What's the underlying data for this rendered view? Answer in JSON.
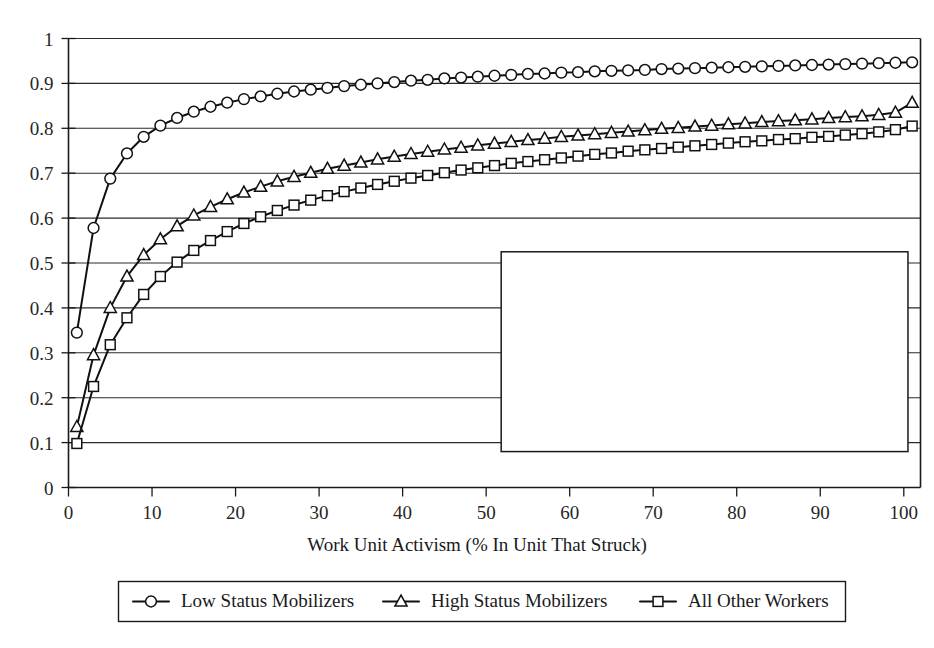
{
  "chart_data": {
    "type": "line",
    "title": "",
    "subtitle": "",
    "xlabel": "Work Unit Activism (% In Unit That Struck)",
    "ylabel": "",
    "xlim": [
      0,
      102
    ],
    "ylim": [
      0,
      1
    ],
    "grid": "horizontal",
    "legend_position": "bottom",
    "xticks": [
      0,
      10,
      20,
      30,
      40,
      50,
      60,
      70,
      80,
      90,
      100
    ],
    "xtick_labels": [
      "0",
      "10",
      "20",
      "30",
      "40",
      "50",
      "60",
      "70",
      "80",
      "90",
      "100"
    ],
    "yticks": [
      0,
      0.1,
      0.2,
      0.3,
      0.4,
      0.5,
      0.6,
      0.7,
      0.8,
      0.9,
      1
    ],
    "ytick_labels": [
      "0",
      "0.1",
      "0.2",
      "0.3",
      "0.4",
      "0.5",
      "0.6",
      "0.7",
      "0.8",
      "0.9",
      "1"
    ],
    "x": [
      1,
      3,
      5,
      7,
      9,
      11,
      13,
      15,
      17,
      19,
      21,
      23,
      25,
      27,
      29,
      31,
      33,
      35,
      37,
      39,
      41,
      43,
      45,
      47,
      49,
      51,
      53,
      55,
      57,
      59,
      61,
      63,
      65,
      67,
      69,
      71,
      73,
      75,
      77,
      79,
      81,
      83,
      85,
      87,
      89,
      91,
      93,
      95,
      97,
      99,
      101
    ],
    "series": [
      {
        "name": "Low Status Mobilizers",
        "marker": "circle",
        "values": [
          0.345,
          0.578,
          0.688,
          0.744,
          0.781,
          0.806,
          0.823,
          0.837,
          0.848,
          0.857,
          0.865,
          0.871,
          0.877,
          0.882,
          0.886,
          0.89,
          0.894,
          0.897,
          0.9,
          0.903,
          0.906,
          0.908,
          0.911,
          0.913,
          0.915,
          0.917,
          0.919,
          0.921,
          0.922,
          0.924,
          0.925,
          0.927,
          0.928,
          0.929,
          0.93,
          0.932,
          0.933,
          0.934,
          0.935,
          0.936,
          0.937,
          0.938,
          0.939,
          0.94,
          0.941,
          0.942,
          0.943,
          0.944,
          0.945,
          0.946,
          0.947
        ]
      },
      {
        "name": "High Status Mobilizers",
        "marker": "triangle",
        "values": [
          0.135,
          0.295,
          0.4,
          0.47,
          0.518,
          0.553,
          0.582,
          0.606,
          0.625,
          0.642,
          0.657,
          0.67,
          0.682,
          0.692,
          0.701,
          0.71,
          0.717,
          0.724,
          0.731,
          0.737,
          0.743,
          0.748,
          0.753,
          0.757,
          0.762,
          0.766,
          0.77,
          0.774,
          0.777,
          0.781,
          0.784,
          0.787,
          0.79,
          0.793,
          0.796,
          0.799,
          0.801,
          0.804,
          0.806,
          0.809,
          0.811,
          0.814,
          0.816,
          0.818,
          0.82,
          0.823,
          0.825,
          0.827,
          0.83,
          0.835,
          0.857
        ]
      },
      {
        "name": "All Other Workers",
        "marker": "square",
        "values": [
          0.098,
          0.225,
          0.318,
          0.378,
          0.43,
          0.47,
          0.502,
          0.528,
          0.55,
          0.57,
          0.588,
          0.603,
          0.617,
          0.629,
          0.64,
          0.65,
          0.659,
          0.667,
          0.675,
          0.682,
          0.689,
          0.695,
          0.701,
          0.707,
          0.712,
          0.717,
          0.722,
          0.726,
          0.73,
          0.734,
          0.738,
          0.742,
          0.745,
          0.749,
          0.752,
          0.755,
          0.758,
          0.761,
          0.764,
          0.767,
          0.77,
          0.772,
          0.775,
          0.777,
          0.78,
          0.782,
          0.785,
          0.788,
          0.792,
          0.797,
          0.805
        ]
      }
    ],
    "annotations": [
      {
        "name": "blank-overlay-rectangle",
        "x_range": [
          51.8,
          100.5
        ],
        "y_range": [
          0.08,
          0.525
        ]
      }
    ]
  },
  "legend": {
    "entries": [
      {
        "label": "Low Status Mobilizers",
        "marker": "circle"
      },
      {
        "label": "High Status Mobilizers",
        "marker": "triangle"
      },
      {
        "label": "All Other Workers",
        "marker": "square"
      }
    ]
  }
}
